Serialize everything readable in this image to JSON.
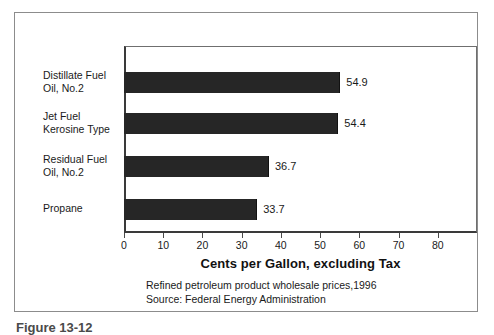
{
  "chart_data": {
    "type": "bar",
    "orientation": "horizontal",
    "title": "",
    "xlabel": "Cents per Gallon, excluding Tax",
    "ylabel": "",
    "xlim": [
      0,
      90
    ],
    "xticks": [
      0,
      10,
      20,
      30,
      40,
      50,
      60,
      70,
      80
    ],
    "grid": false,
    "legend": false,
    "bar_color": "#262626",
    "categories": [
      "Distillate Fuel\nOil, No.2",
      "Jet Fuel\nKerosine Type",
      "Residual Fuel\nOil, No.2",
      "Propane"
    ],
    "values": [
      54.9,
      54.4,
      36.7,
      33.7
    ],
    "value_labels": [
      "54.9",
      "54.4",
      "36.7",
      "33.7"
    ]
  },
  "caption": {
    "line1": "Refined petroleum product wholesale prices,1996",
    "line2": "Source: Federal Energy Administration"
  },
  "figure_caption": "Figure 13-12",
  "axis": {
    "title": "Cents per Gallon, excluding Tax",
    "tick_labels": [
      "0",
      "10",
      "20",
      "30",
      "40",
      "50",
      "60",
      "70",
      "80"
    ]
  }
}
